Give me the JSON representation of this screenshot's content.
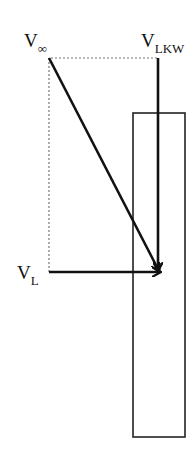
{
  "diagram": {
    "type": "velocity-vector-diagram",
    "labels": {
      "v_inf": {
        "main": "V",
        "sub": "∞"
      },
      "v_lkw": {
        "main": "V",
        "sub": "LKW"
      },
      "v_l": {
        "main": "V",
        "sub": "L"
      }
    },
    "colors": {
      "stroke": "#111111",
      "dotted": "#777777",
      "background": "#ffffff"
    },
    "elements": [
      {
        "name": "V∞",
        "kind": "arrow",
        "from": [
          49,
          58
        ],
        "to": [
          160,
          272
        ]
      },
      {
        "name": "VLKW",
        "kind": "arrow",
        "from": [
          158,
          58
        ],
        "to": [
          158,
          272
        ]
      },
      {
        "name": "VL",
        "kind": "arrow",
        "from": [
          49,
          272
        ],
        "to": [
          160,
          272
        ]
      },
      {
        "name": "vehicle-outline",
        "kind": "rectangle",
        "x": 133,
        "y": 113,
        "w": 52,
        "h": 324
      },
      {
        "name": "construction-lines",
        "kind": "dotted",
        "points": [
          [
            49,
            272
          ],
          [
            49,
            58
          ],
          [
            158,
            58
          ]
        ]
      }
    ]
  }
}
